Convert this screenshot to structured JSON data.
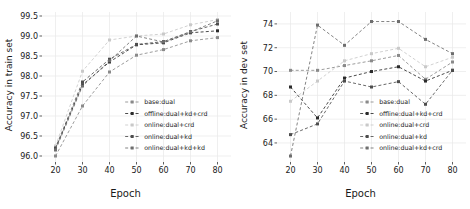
{
  "figure": {
    "panels": [
      "train",
      "dev"
    ],
    "colors": {
      "axis": "#1a1a1a",
      "grid": "#e8e8e8",
      "s0": "#8a8a8a",
      "s1": "#2b2b2b",
      "s2": "#c9c9c9",
      "s3": "#4d4d4d",
      "s4": "#6e6e6e"
    }
  },
  "chart_data": [
    {
      "type": "line",
      "panel": "left",
      "title": "",
      "xlabel": "Epoch",
      "ylabel": "Accuracy in train set",
      "x": [
        20,
        30,
        40,
        50,
        60,
        70,
        80
      ],
      "xticks": [
        "20",
        "30",
        "40",
        "50",
        "60",
        "70",
        "80"
      ],
      "yticks": [
        "96.0",
        "96.5",
        "97.0",
        "97.5",
        "98.0",
        "98.5",
        "99.0",
        "99.5"
      ],
      "xlim": [
        15,
        85
      ],
      "ylim": [
        95.85,
        99.6
      ],
      "grid": true,
      "legend_position": "lower-right",
      "series": [
        {
          "name": "base:dual",
          "values": [
            96.0,
            97.25,
            98.1,
            98.52,
            98.66,
            98.88,
            98.96
          ]
        },
        {
          "name": "offline:dual+kd+crd",
          "values": [
            96.18,
            97.78,
            98.35,
            98.78,
            98.83,
            99.08,
            99.13
          ]
        },
        {
          "name": "online:dual+crd",
          "values": [
            96.25,
            98.12,
            98.9,
            99.0,
            99.05,
            99.28,
            99.41
          ]
        },
        {
          "name": "online:dual+kd",
          "values": [
            96.2,
            97.85,
            98.42,
            98.79,
            98.86,
            99.11,
            99.3
          ]
        },
        {
          "name": "online:dual+kd+kd",
          "values": [
            96.15,
            97.75,
            98.38,
            99.0,
            98.85,
            99.1,
            99.38
          ]
        }
      ]
    },
    {
      "type": "line",
      "panel": "right",
      "title": "",
      "xlabel": "Epoch",
      "ylabel": "Accuracy in dev set",
      "x": [
        20,
        30,
        40,
        50,
        60,
        70,
        80
      ],
      "xticks": [
        "20",
        "30",
        "40",
        "50",
        "60",
        "70",
        "80"
      ],
      "yticks": [
        "64",
        "66",
        "68",
        "70",
        "72",
        "74"
      ],
      "xlim": [
        15,
        85
      ],
      "ylim": [
        62.4,
        75.0
      ],
      "grid": true,
      "legend_position": "lower-right",
      "series": [
        {
          "name": "base:dual",
          "values": [
            70.1,
            70.1,
            70.5,
            70.9,
            71.35,
            69.35,
            70.8
          ]
        },
        {
          "name": "offline:dual+kd+crd",
          "values": [
            68.7,
            66.1,
            69.45,
            70.0,
            70.4,
            69.2,
            70.1
          ]
        },
        {
          "name": "online:dual+crd",
          "values": [
            67.5,
            69.2,
            70.9,
            71.5,
            71.95,
            70.4,
            71.2
          ]
        },
        {
          "name": "online:dual+kd",
          "values": [
            64.7,
            65.6,
            69.2,
            68.7,
            69.15,
            67.25,
            70.1
          ]
        },
        {
          "name": "online:dual+kd+crd",
          "values": [
            62.9,
            73.9,
            72.2,
            74.2,
            74.2,
            72.7,
            71.5
          ]
        }
      ]
    }
  ],
  "legend": {
    "left": [
      "base:dual",
      "offline:dual+kd+crd",
      "online:dual+crd",
      "online:dual+kd",
      "online:dual+kd+kd"
    ],
    "right": [
      "base:dual",
      "offline:dual+kd+crd",
      "online:dual+crd",
      "online:dual+kd",
      "online:dual+kd+crd"
    ]
  }
}
